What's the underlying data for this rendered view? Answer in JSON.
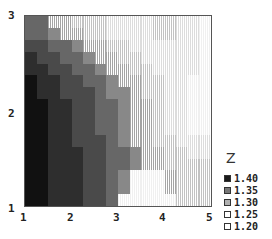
{
  "chart_data": {
    "type": "heatmap",
    "title": "",
    "xlabel": "",
    "ylabel": "",
    "x_ticks": [
      "1",
      "2",
      "3",
      "4",
      "5"
    ],
    "y_ticks": [
      "1",
      "2",
      "3"
    ],
    "xlim": [
      1,
      5
    ],
    "ylim": [
      1,
      3
    ],
    "colorbar_title": "Z",
    "legend": [
      "1.40",
      "1.35",
      "1.30",
      "1.25",
      "1.20"
    ],
    "levels_note": "0=highest Z (darkest) ... 8=lowest Z (lightest)",
    "grid_rows_top_to_bottom": [
      [
        3,
        3,
        5,
        5,
        6,
        6,
        6,
        7,
        7,
        7,
        7,
        6,
        6,
        7,
        7,
        8
      ],
      [
        3,
        3,
        4,
        5,
        5,
        6,
        6,
        7,
        7,
        7,
        7,
        6,
        6,
        7,
        7,
        8
      ],
      [
        2,
        2,
        3,
        3,
        4,
        5,
        5,
        6,
        6,
        7,
        7,
        7,
        7,
        7,
        7,
        8
      ],
      [
        1,
        2,
        2,
        3,
        3,
        4,
        5,
        5,
        6,
        6,
        7,
        7,
        7,
        7,
        7,
        8
      ],
      [
        1,
        1,
        2,
        2,
        3,
        3,
        4,
        5,
        5,
        6,
        6,
        7,
        7,
        7,
        7,
        8
      ],
      [
        0,
        1,
        1,
        2,
        2,
        3,
        3,
        4,
        5,
        5,
        6,
        6,
        7,
        7,
        8,
        8
      ],
      [
        0,
        1,
        1,
        2,
        2,
        2,
        3,
        4,
        4,
        5,
        6,
        6,
        7,
        7,
        8,
        8
      ],
      [
        0,
        0,
        1,
        1,
        2,
        2,
        3,
        3,
        4,
        5,
        5,
        6,
        7,
        7,
        8,
        8
      ],
      [
        0,
        0,
        1,
        1,
        2,
        2,
        3,
        3,
        4,
        5,
        5,
        6,
        7,
        7,
        8,
        8
      ],
      [
        0,
        0,
        1,
        1,
        2,
        2,
        3,
        3,
        4,
        5,
        5,
        6,
        7,
        7,
        8,
        8
      ],
      [
        0,
        0,
        1,
        1,
        2,
        2,
        2,
        3,
        4,
        5,
        5,
        6,
        6,
        7,
        7,
        7
      ],
      [
        0,
        0,
        1,
        1,
        1,
        2,
        2,
        3,
        3,
        4,
        5,
        5,
        6,
        6,
        7,
        7
      ],
      [
        0,
        0,
        1,
        1,
        1,
        2,
        2,
        3,
        3,
        4,
        5,
        5,
        6,
        6,
        6,
        6
      ],
      [
        0,
        0,
        1,
        1,
        1,
        2,
        2,
        3,
        4,
        8,
        8,
        8,
        5,
        6,
        6,
        6
      ],
      [
        0,
        0,
        1,
        1,
        1,
        2,
        2,
        3,
        4,
        8,
        8,
        8,
        5,
        6,
        6,
        6
      ],
      [
        0,
        0,
        1,
        1,
        1,
        2,
        2,
        3,
        8,
        8,
        8,
        8,
        8,
        6,
        6,
        6
      ]
    ],
    "level_colors": [
      "#111111",
      "#2e2e2e",
      "#4a4a4a",
      "#676767",
      "#888888",
      "#a4a4a4",
      "#c2c2c2",
      "#dcdcdc",
      "#f0f0f0"
    ],
    "legend_colors": [
      "#1a1a1a",
      "#777777",
      "#b0b0b0",
      "#ffffff",
      "#ffffff"
    ]
  }
}
